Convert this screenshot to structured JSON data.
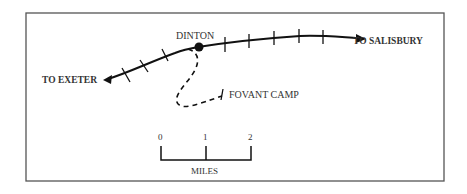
{
  "map": {
    "places": {
      "dinton": "DINTON",
      "fovant_camp": "FOVANT CAMP"
    },
    "directions": {
      "to_exeter": "TO EXETER",
      "to_salisbury": "TO SALISBURY"
    },
    "scale": {
      "ticks": [
        "0",
        "1",
        "2"
      ],
      "unit": "MILES"
    },
    "colors": {
      "line": "#111111",
      "border": "#555555",
      "text": "#333333"
    }
  }
}
